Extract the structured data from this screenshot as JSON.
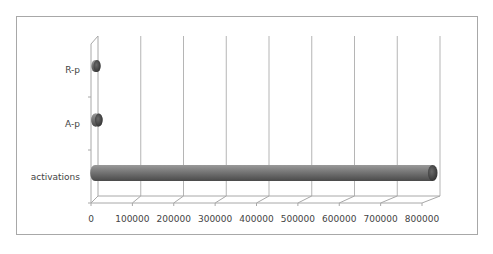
{
  "chart_data": {
    "type": "bar",
    "orientation": "horizontal",
    "style": "3d-cylinder",
    "title": "",
    "xlabel": "",
    "ylabel": "",
    "categories": [
      "activations",
      "A-p",
      "R-p"
    ],
    "values": [
      790000,
      9000,
      5000
    ],
    "xlim": [
      0,
      800000
    ],
    "x_ticks": [
      "0",
      "100000",
      "200000",
      "300000",
      "400000",
      "500000",
      "600000",
      "700000",
      "800000"
    ],
    "grid": true,
    "legend": null,
    "bar_color": "#7a7a7a"
  },
  "labels": {
    "cat_0": "activations",
    "cat_1": "A-p",
    "cat_2": "R-p"
  }
}
